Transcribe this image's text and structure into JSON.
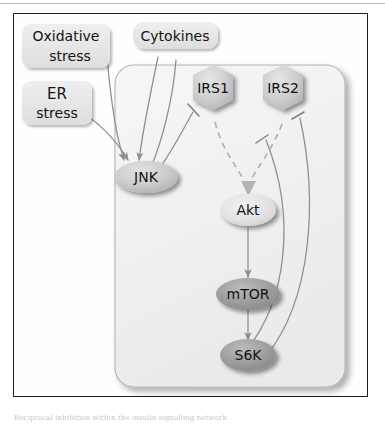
{
  "figure": {
    "frame_color": "#1c1c1c",
    "background": "#ffffff"
  },
  "compartment": {
    "name": "cell-boundary",
    "fill": "#f2f2f2",
    "stroke": "#b0b0b0"
  },
  "stimuli": [
    {
      "id": "oxidative-stress",
      "label_line1": "Oxidative",
      "label_line2": "stress",
      "shape": "rounded-box",
      "fill": "#eeeeee"
    },
    {
      "id": "er-stress",
      "label_line1": "ER",
      "label_line2": "stress",
      "shape": "rounded-box",
      "fill": "#e2e2e2"
    },
    {
      "id": "cytokines",
      "label_line1": "Cytokines",
      "label_line2": "",
      "shape": "rounded-box",
      "fill": "#e0e0e0"
    }
  ],
  "nodes": [
    {
      "id": "irs1",
      "label": "IRS1",
      "shape": "hexagon",
      "fill": "#c8c8c8"
    },
    {
      "id": "irs2",
      "label": "IRS2",
      "shape": "hexagon",
      "fill": "#c8c8c8"
    },
    {
      "id": "jnk",
      "label": "JNK",
      "shape": "ellipse",
      "fill": "#cfcfcf"
    },
    {
      "id": "akt",
      "label": "Akt",
      "shape": "ellipse",
      "fill": "#e0e0e0"
    },
    {
      "id": "mtor",
      "label": "mTOR",
      "shape": "ellipse",
      "fill": "#9c9c9c"
    },
    {
      "id": "s6k",
      "label": "S6K",
      "shape": "ellipse",
      "fill": "#9a9a9a"
    }
  ],
  "edges": [
    {
      "id": "oxidative-to-jnk",
      "from": "oxidative-stress",
      "to": "jnk",
      "type": "activation",
      "style": "solid"
    },
    {
      "id": "er-to-jnk",
      "from": "er-stress",
      "to": "jnk",
      "type": "activation",
      "style": "solid"
    },
    {
      "id": "cytokines-to-jnk",
      "from": "cytokines",
      "to": "jnk",
      "type": "activation",
      "style": "solid"
    },
    {
      "id": "jnk-to-irs1",
      "from": "jnk",
      "to": "irs1",
      "type": "inhibition",
      "style": "solid"
    },
    {
      "id": "irs1-to-akt",
      "from": "irs1",
      "to": "akt",
      "type": "activation",
      "style": "dashed"
    },
    {
      "id": "irs2-to-akt",
      "from": "irs2",
      "to": "akt",
      "type": "activation",
      "style": "dashed"
    },
    {
      "id": "akt-to-mtor",
      "from": "akt",
      "to": "mtor",
      "type": "activation",
      "style": "solid"
    },
    {
      "id": "mtor-to-s6k",
      "from": "mtor",
      "to": "s6k",
      "type": "activation",
      "style": "solid"
    },
    {
      "id": "s6k-to-irs1",
      "from": "s6k",
      "to": "irs1",
      "type": "inhibition",
      "style": "solid"
    },
    {
      "id": "s6k-to-irs2",
      "from": "s6k",
      "to": "irs2",
      "type": "inhibition",
      "style": "solid"
    }
  ],
  "caption": {
    "text": "Reciprocal inhibition within the insulin signalling network"
  },
  "colors": {
    "edge": "#8f8f8f",
    "edge_dark": "#7a7a7a",
    "text": "#111111"
  }
}
